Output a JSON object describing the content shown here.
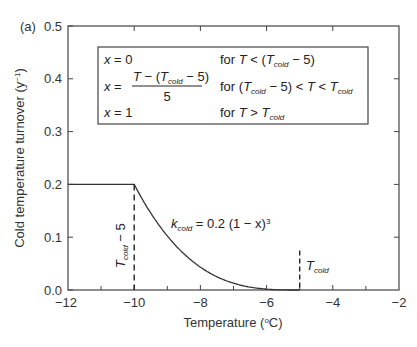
{
  "chart_data": {
    "type": "line",
    "panel_label": "(a)",
    "title": "",
    "xlabel": "Temperature (°C)",
    "ylabel": "Cold temperature turnover (y⁻¹)",
    "xlim": [
      -12,
      -2
    ],
    "ylim": [
      0.0,
      0.5
    ],
    "x_ticks": [
      -12,
      -10,
      -8,
      -6,
      -4,
      -2
    ],
    "x_tick_labels": [
      "−12",
      "−10",
      "−8",
      "−6",
      "−4",
      "−2"
    ],
    "x_minor_ticks": [
      -11,
      -9,
      -7,
      -5,
      -3
    ],
    "y_ticks": [
      0.0,
      0.1,
      0.2,
      0.3,
      0.4,
      0.5
    ],
    "y_tick_labels": [
      "0.0",
      "0.1",
      "0.2",
      "0.3",
      "0.4",
      "0.5"
    ],
    "grid": false,
    "legend": null,
    "series": [
      {
        "name": "k_cold = 0.2 (1 − x)^3",
        "style": "solid",
        "color": "#333333",
        "x": [
          -12,
          -10,
          -9.5,
          -9,
          -8.5,
          -8,
          -7.5,
          -7,
          -6.5,
          -6,
          -5
        ],
        "y": [
          0.2,
          0.2,
          0.1458,
          0.1024,
          0.0686,
          0.0432,
          0.025,
          0.0128,
          0.0054,
          0.0016,
          0.0
        ]
      }
    ],
    "reference_lines": [
      {
        "name": "T_cold − 5",
        "x": -10,
        "y_range": [
          0.0,
          0.2
        ],
        "style": "dashed"
      },
      {
        "name": "T_cold",
        "x": -5,
        "y_range": [
          0.0,
          0.075
        ],
        "style": "dashed"
      }
    ],
    "annotations": {
      "curve_label": {
        "main": "k",
        "sub": "cold",
        "rest": " = 0.2 (1 − x)",
        "sup": "3"
      },
      "vline1_label": {
        "main": "T",
        "sub": "cold",
        "rest": " − 5"
      },
      "vline2_label": {
        "main": "T",
        "sub": "cold"
      },
      "box": {
        "rows": [
          {
            "lhs": "x = 0",
            "cond": "for T < (T_cold − 5)"
          },
          {
            "lhs": "x = [T − (T_cold − 5)] / 5",
            "cond": "for (T_cold − 5) < T < T_cold"
          },
          {
            "lhs": "x = 1",
            "cond": "for T > T_cold"
          }
        ]
      }
    }
  },
  "text": {
    "panel_label": "(a)",
    "xlabel": "Temperature (",
    "xlabel_deg": "o",
    "xlabel_unit": "C)",
    "ylabel": "Cold temperature turnover (y",
    "ylabel_sup": "−1",
    "ylabel_close": ")",
    "x_ticks": [
      "−12",
      "−10",
      "−8",
      "−6",
      "−4",
      "−2"
    ],
    "y_ticks": [
      "0.0",
      "0.1",
      "0.2",
      "0.3",
      "0.4",
      "0.5"
    ],
    "box_row1_lhs": "x = 0",
    "box_row1_for": "for ",
    "box_row1_T": "T",
    "box_row1_mid": " < (",
    "box_row1_T2": "T",
    "box_row1_sub": "cold",
    "box_row1_end": " − 5)",
    "box_row2_lhs": "x =",
    "box_row2_num_T": "T",
    "box_row2_num_mid": " − (",
    "box_row2_num_T2": "T",
    "box_row2_num_sub": "cold",
    "box_row2_num_end": " − 5)",
    "box_row2_den": "5",
    "box_row2_for": "for (",
    "box_row2_T": "T",
    "box_row2_sub": "cold",
    "box_row2_mid": " − 5) < ",
    "box_row2_T2": "T",
    "box_row2_lt": " < ",
    "box_row2_T3": "T",
    "box_row2_sub2": "cold",
    "box_row3_lhs": "x = 1",
    "box_row3_for": "for ",
    "box_row3_T": "T",
    "box_row3_gt": " > ",
    "box_row3_T2": "T",
    "box_row3_sub": "cold",
    "curve_k": "k",
    "curve_sub": "cold",
    "curve_rest": " = 0.2 (1 − x)",
    "curve_sup": "3",
    "vline1_T": "T",
    "vline1_sub": "cold",
    "vline1_rest": " − 5",
    "vline2_T": "T",
    "vline2_sub": "cold"
  }
}
